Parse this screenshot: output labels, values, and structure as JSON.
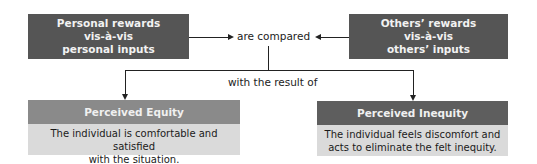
{
  "diagram": {
    "left_input": {
      "lines": [
        "Personal rewards",
        "vis-à-vis",
        "personal inputs"
      ]
    },
    "right_input": {
      "lines": [
        "Others’ rewards",
        "vis-à-vis",
        "others’ inputs"
      ]
    },
    "comparison_label": "are compared",
    "result_label": "with the result of",
    "outcomes": [
      {
        "title": "Perceived Equity",
        "header_color": "#8a8a8a",
        "description_lines": [
          "The individual is comfortable and satisfied",
          "with the situation."
        ]
      },
      {
        "title": "Perceived Inequity",
        "header_color": "#5e5e5e",
        "description_lines": [
          "The individual feels discomfort and",
          "acts to eliminate the felt inequity."
        ]
      }
    ],
    "colors": {
      "input_box": "#555555",
      "outcome_body": "#dadada",
      "connector": "#222222"
    }
  }
}
